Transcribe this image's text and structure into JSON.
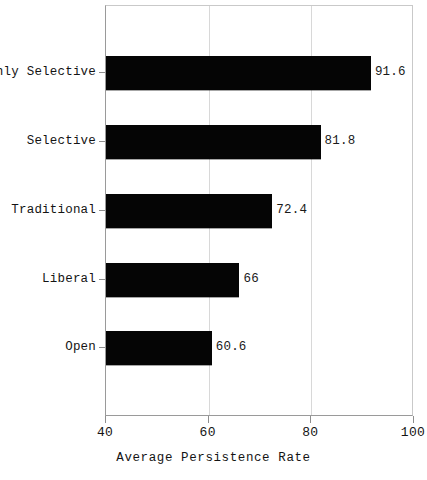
{
  "chart_data": {
    "type": "bar",
    "orientation": "horizontal",
    "title": "",
    "xlabel": "Average Persistence Rate",
    "ylabel": "",
    "categories": [
      "Highly Selective",
      "Selective",
      "Traditional",
      "Liberal",
      "Open"
    ],
    "values": [
      91.6,
      81.8,
      72.4,
      66,
      60.6
    ],
    "value_labels": [
      "91.6",
      "81.8",
      "72.4",
      "66",
      "60.6"
    ],
    "xlim": [
      40,
      100
    ],
    "xticks": [
      40,
      60,
      80,
      100
    ],
    "xtick_labels": [
      "40",
      "60",
      "80",
      "100"
    ],
    "grid": true,
    "gridlines_at": [
      60,
      80
    ],
    "legend": null,
    "bar_color": "#050505",
    "background_color": "#ffffff",
    "axis_color": "#8e8e8e",
    "grid_color": "#d8d8d8"
  }
}
